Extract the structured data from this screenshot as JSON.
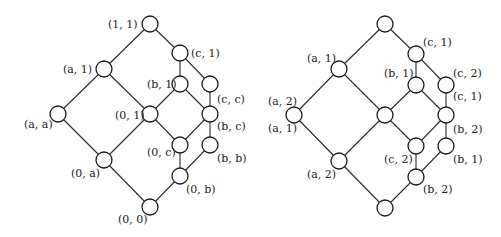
{
  "diagrams": [
    {
      "id": "left-lattice",
      "node_radius": 8,
      "nodes": [
        {
          "id": "n11",
          "x": 150,
          "y": 24,
          "label": "(1, 1)",
          "lx": 108,
          "ly": 28,
          "anchor": "start"
        },
        {
          "id": "nc1",
          "x": 180,
          "y": 53,
          "label": "(c, 1)",
          "lx": 191,
          "ly": 57,
          "anchor": "start"
        },
        {
          "id": "na1",
          "x": 104,
          "y": 69,
          "label": "(a, 1)",
          "lx": 63,
          "ly": 73,
          "anchor": "start"
        },
        {
          "id": "nb1",
          "x": 180,
          "y": 84,
          "label": "(b, 1)",
          "lx": 147,
          "ly": 88,
          "anchor": "start"
        },
        {
          "id": "ncc",
          "x": 210,
          "y": 84,
          "label": "(c, c)",
          "lx": 217,
          "ly": 103,
          "anchor": "start"
        },
        {
          "id": "naa",
          "x": 58,
          "y": 114,
          "label": "(a, a)",
          "lx": 24,
          "ly": 128,
          "anchor": "start"
        },
        {
          "id": "n01",
          "x": 150,
          "y": 114,
          "label": "(0, 1)",
          "lx": 115,
          "ly": 119,
          "anchor": "start"
        },
        {
          "id": "nbc",
          "x": 210,
          "y": 114,
          "label": "(b, c)",
          "lx": 217,
          "ly": 130,
          "anchor": "start"
        },
        {
          "id": "n0c",
          "x": 180,
          "y": 145,
          "label": "(0, c)",
          "lx": 147,
          "ly": 156,
          "anchor": "start"
        },
        {
          "id": "nbb",
          "x": 210,
          "y": 145,
          "label": "(b, b)",
          "lx": 217,
          "ly": 162,
          "anchor": "start"
        },
        {
          "id": "n0a",
          "x": 104,
          "y": 160,
          "label": "(0, a)",
          "lx": 71,
          "ly": 177,
          "anchor": "start"
        },
        {
          "id": "n0b",
          "x": 180,
          "y": 176,
          "label": "(0, b)",
          "lx": 186,
          "ly": 193,
          "anchor": "start"
        },
        {
          "id": "n00",
          "x": 150,
          "y": 207,
          "label": "(0, 0)",
          "lx": 118,
          "ly": 223,
          "anchor": "start"
        }
      ],
      "edges": [
        [
          "n11",
          "na1"
        ],
        [
          "n11",
          "nc1"
        ],
        [
          "na1",
          "naa"
        ],
        [
          "na1",
          "n01"
        ],
        [
          "nc1",
          "nb1"
        ],
        [
          "nc1",
          "ncc"
        ],
        [
          "nb1",
          "n01"
        ],
        [
          "nb1",
          "nbc"
        ],
        [
          "ncc",
          "nbc"
        ],
        [
          "naa",
          "n0a"
        ],
        [
          "n01",
          "n0a"
        ],
        [
          "n01",
          "n0c"
        ],
        [
          "nbc",
          "n0c"
        ],
        [
          "nbc",
          "nbb"
        ],
        [
          "n0c",
          "n0b"
        ],
        [
          "nbb",
          "n0b"
        ],
        [
          "n0a",
          "n00"
        ],
        [
          "n0b",
          "n00"
        ]
      ]
    },
    {
      "id": "right-lattice",
      "node_radius": 8,
      "nodes": [
        {
          "id": "rtop",
          "x": 385,
          "y": 24,
          "label": "",
          "lx": 0,
          "ly": 0,
          "anchor": "start"
        },
        {
          "id": "rc1",
          "x": 416,
          "y": 54,
          "label": "(c, 1)",
          "lx": 423,
          "ly": 46,
          "anchor": "start"
        },
        {
          "id": "ra1",
          "x": 339,
          "y": 69,
          "label": "(a, 1)",
          "lx": 307,
          "ly": 62,
          "anchor": "start"
        },
        {
          "id": "rb1",
          "x": 416,
          "y": 85,
          "label": "(b, 1)",
          "lx": 384,
          "ly": 77,
          "anchor": "start"
        },
        {
          "id": "rcc",
          "x": 446,
          "y": 85,
          "label": "(c, 2)",
          "lx": 453,
          "ly": 77,
          "anchor": "start"
        },
        {
          "id": "raa",
          "x": 294,
          "y": 115,
          "label": "(a, 2)",
          "lx": 268,
          "ly": 105,
          "anchor": "start"
        },
        {
          "id": "r01",
          "x": 385,
          "y": 115,
          "label": "",
          "lx": 0,
          "ly": 0,
          "anchor": "start"
        },
        {
          "id": "rbc",
          "x": 446,
          "y": 115,
          "label": "(c, 1)",
          "lx": 453,
          "ly": 100,
          "anchor": "start"
        },
        {
          "id": "r0c",
          "x": 416,
          "y": 146,
          "label": "(c, 2)",
          "lx": 384,
          "ly": 163,
          "anchor": "start"
        },
        {
          "id": "rbb",
          "x": 446,
          "y": 146,
          "label": "(b, 1)",
          "lx": 453,
          "ly": 163,
          "anchor": "start"
        },
        {
          "id": "r0a",
          "x": 339,
          "y": 161,
          "label": "(a, 2)",
          "lx": 307,
          "ly": 178,
          "anchor": "start"
        },
        {
          "id": "r0b",
          "x": 416,
          "y": 177,
          "label": "(b, 2)",
          "lx": 423,
          "ly": 193,
          "anchor": "start"
        },
        {
          "id": "rbot",
          "x": 385,
          "y": 208,
          "label": "",
          "lx": 0,
          "ly": 0,
          "anchor": "start"
        }
      ],
      "extra_labels": [
        {
          "text": "(a, 1)",
          "x": 268,
          "y": 132
        },
        {
          "text": "(b, 2)",
          "x": 453,
          "y": 133
        }
      ],
      "edges": [
        [
          "rtop",
          "ra1"
        ],
        [
          "rtop",
          "rc1"
        ],
        [
          "ra1",
          "raa"
        ],
        [
          "ra1",
          "r01"
        ],
        [
          "rc1",
          "rb1"
        ],
        [
          "rc1",
          "rcc"
        ],
        [
          "rb1",
          "r01"
        ],
        [
          "rb1",
          "rbc"
        ],
        [
          "rcc",
          "rbc"
        ],
        [
          "raa",
          "r0a"
        ],
        [
          "r01",
          "r0a"
        ],
        [
          "r01",
          "r0c"
        ],
        [
          "rbc",
          "r0c"
        ],
        [
          "rbc",
          "rbb"
        ],
        [
          "r0c",
          "r0b"
        ],
        [
          "rbb",
          "r0b"
        ],
        [
          "r0a",
          "rbot"
        ],
        [
          "r0b",
          "rbot"
        ]
      ]
    }
  ]
}
